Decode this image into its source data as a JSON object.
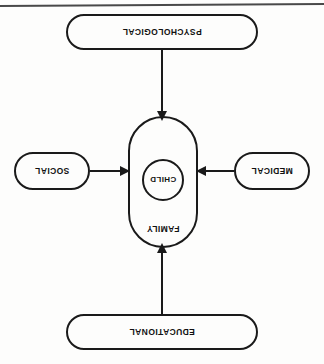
{
  "diagram": {
    "title": "CHILD",
    "center": {
      "outer_label": "FAMILY",
      "inner_label": "CHILD"
    },
    "nodes": [
      {
        "id": "psychological",
        "label": "PSYCHOLOGICAL",
        "position": "top"
      },
      {
        "id": "medical",
        "label": "MEDICAL",
        "position": "right"
      },
      {
        "id": "educational",
        "label": "EDUCATIONAL",
        "position": "bottom"
      },
      {
        "id": "social",
        "label": "SOCIAL",
        "position": "left"
      }
    ],
    "connectors": [
      {
        "from": "psychological",
        "to": "family",
        "direction": "down"
      },
      {
        "from": "educational",
        "to": "family",
        "direction": "up"
      },
      {
        "from": "social",
        "to": "family",
        "direction": "right"
      },
      {
        "from": "medical",
        "to": "family",
        "direction": "left"
      }
    ],
    "style": {
      "stroke": "#1a1a1a",
      "background": "#fdfdfc",
      "orientation": "rotated-180"
    }
  }
}
